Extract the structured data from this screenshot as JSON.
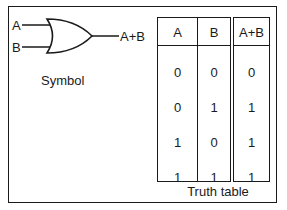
{
  "symbol": {
    "input_a": "A",
    "input_b": "B",
    "output": "A+B",
    "caption": "Symbol",
    "gate_type": "OR"
  },
  "truth_table": {
    "caption": "Truth table",
    "headers": [
      "A",
      "B",
      "A+B"
    ],
    "rows": [
      [
        "0",
        "0",
        "0"
      ],
      [
        "0",
        "1",
        "1"
      ],
      [
        "1",
        "0",
        "1"
      ],
      [
        "1",
        "1",
        "1"
      ]
    ]
  }
}
